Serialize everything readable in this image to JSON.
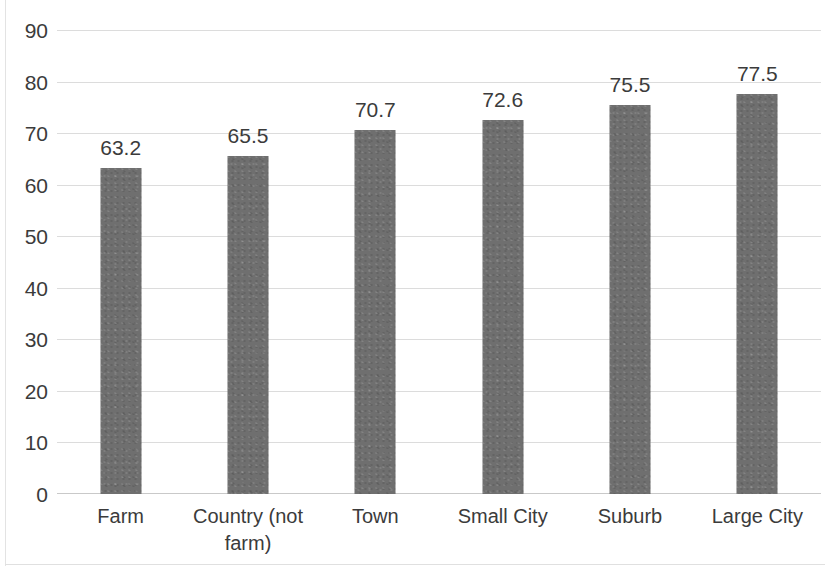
{
  "chart_data": {
    "type": "bar",
    "title": "",
    "subtitle": "",
    "xlabel": "",
    "ylabel": "",
    "categories": [
      "Farm",
      "Country (not farm)",
      "Town",
      "Small City",
      "Suburb",
      "Large City"
    ],
    "values": [
      63.2,
      65.5,
      70.7,
      72.6,
      75.5,
      77.5
    ],
    "data_labels": [
      "63.2",
      "65.5",
      "70.7",
      "72.6",
      "75.5",
      "77.5"
    ],
    "ylim": [
      0,
      90
    ],
    "ytick_values": [
      0,
      10,
      20,
      30,
      40,
      50,
      60,
      70,
      80,
      90
    ],
    "ytick_labels": [
      "0",
      "10",
      "20",
      "30",
      "40",
      "50",
      "60",
      "70",
      "80",
      "90"
    ],
    "grid": true,
    "grid_axis": "y",
    "legend": null,
    "legend_position": "none",
    "series": [
      {
        "name": "",
        "values": [
          63.2,
          65.5,
          70.7,
          72.6,
          75.5,
          77.5
        ]
      }
    ],
    "colors": {
      "bar": "#6f6f6f",
      "gridline": "#dcdcdc",
      "axis_line": "#c9c9c9",
      "text": "#3b3b3b",
      "background": "#ffffff",
      "frame": "#e3e3e3"
    }
  }
}
